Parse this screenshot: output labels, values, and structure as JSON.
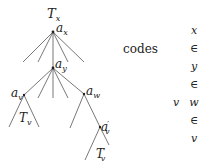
{
  "diagram": {
    "type": "tree",
    "labels": {
      "root_tree": "T",
      "root_tree_sub": "x",
      "ax": "a",
      "ax_sub": "x",
      "ay": "a",
      "ay_sub": "y",
      "av": "a",
      "av_sub": "v",
      "aw": "a",
      "aw_sub": "w",
      "av_prime": "a",
      "av_prime_sup": "′",
      "av_prime_sub": "v",
      "tv": "T",
      "tv_sub": "v",
      "tv_prime": "T",
      "tv_prime_sup": "′",
      "tv_prime_sub": "v"
    },
    "codes_label": "codes",
    "codes_column": [
      "x",
      "∈",
      "y",
      "∈",
      "w",
      "∈",
      "v"
    ],
    "codes_side": "v",
    "line_color": "#555555"
  }
}
